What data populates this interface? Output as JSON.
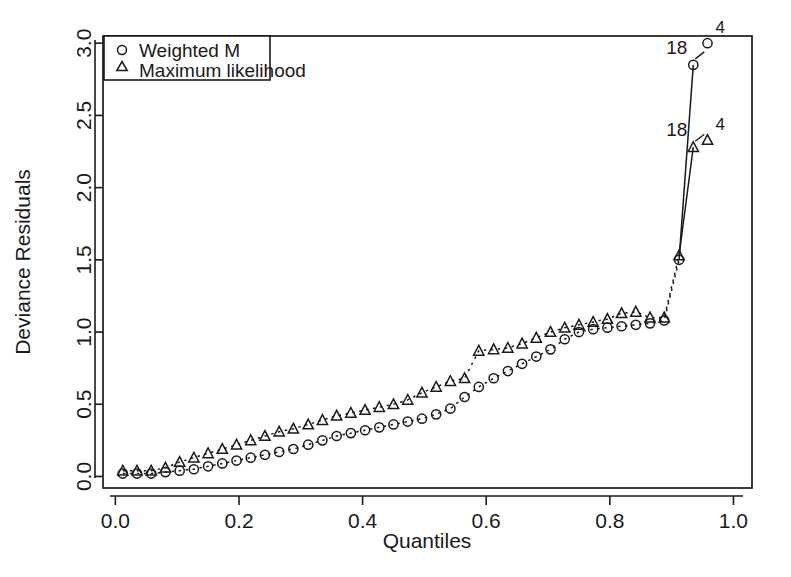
{
  "chart_data": {
    "type": "line",
    "title": "",
    "xlabel": "Quantiles",
    "ylabel": "Deviance Residuals",
    "xlim": [
      -0.02,
      1.03
    ],
    "ylim": [
      -0.08,
      3.05
    ],
    "grid": false,
    "legend_position": "top-left",
    "xticks": [
      "0.0",
      "0.2",
      "0.4",
      "0.6",
      "0.8",
      "1.0"
    ],
    "xtick_values": [
      0.0,
      0.2,
      0.4,
      0.6,
      0.8,
      1.0
    ],
    "yticks": [
      "0.0",
      "0.5",
      "1.0",
      "1.5",
      "2.0",
      "2.5",
      "3.0"
    ],
    "ytick_values": [
      0.0,
      0.5,
      1.0,
      1.5,
      2.0,
      2.5,
      3.0
    ],
    "series": [
      {
        "name": "Weighted M",
        "marker": "circle",
        "linestyle": "dashed",
        "x": [
          0.012,
          0.035,
          0.058,
          0.081,
          0.104,
          0.127,
          0.15,
          0.173,
          0.196,
          0.219,
          0.242,
          0.265,
          0.288,
          0.312,
          0.335,
          0.358,
          0.381,
          0.404,
          0.427,
          0.45,
          0.473,
          0.496,
          0.519,
          0.542,
          0.565,
          0.588,
          0.612,
          0.635,
          0.658,
          0.681,
          0.704,
          0.727,
          0.75,
          0.773,
          0.796,
          0.819,
          0.842,
          0.865,
          0.888,
          0.912,
          0.935,
          0.958
        ],
        "y": [
          0.02,
          0.02,
          0.02,
          0.03,
          0.04,
          0.05,
          0.07,
          0.09,
          0.11,
          0.13,
          0.15,
          0.17,
          0.19,
          0.22,
          0.25,
          0.28,
          0.3,
          0.32,
          0.34,
          0.36,
          0.38,
          0.4,
          0.43,
          0.47,
          0.55,
          0.62,
          0.68,
          0.73,
          0.78,
          0.83,
          0.88,
          0.95,
          1.0,
          1.02,
          1.03,
          1.04,
          1.05,
          1.06,
          1.08,
          1.5,
          2.85,
          3.0
        ]
      },
      {
        "name": "Maximum likelihood",
        "marker": "triangle",
        "linestyle": "dashed",
        "x": [
          0.012,
          0.035,
          0.058,
          0.081,
          0.104,
          0.127,
          0.15,
          0.173,
          0.196,
          0.219,
          0.242,
          0.265,
          0.288,
          0.312,
          0.335,
          0.358,
          0.381,
          0.404,
          0.427,
          0.45,
          0.473,
          0.496,
          0.519,
          0.542,
          0.565,
          0.588,
          0.612,
          0.635,
          0.658,
          0.681,
          0.704,
          0.727,
          0.75,
          0.773,
          0.796,
          0.819,
          0.842,
          0.865,
          0.888,
          0.912,
          0.935,
          0.958
        ],
        "y": [
          0.04,
          0.04,
          0.04,
          0.06,
          0.1,
          0.13,
          0.16,
          0.19,
          0.22,
          0.25,
          0.28,
          0.31,
          0.33,
          0.36,
          0.39,
          0.42,
          0.44,
          0.46,
          0.48,
          0.5,
          0.53,
          0.58,
          0.62,
          0.66,
          0.68,
          0.87,
          0.88,
          0.89,
          0.92,
          0.96,
          1.0,
          1.03,
          1.05,
          1.07,
          1.09,
          1.13,
          1.14,
          1.1,
          1.1,
          1.53,
          2.28,
          2.33
        ]
      }
    ],
    "annotations": [
      {
        "text": "18",
        "series": "Weighted M",
        "x": 0.935,
        "y": 2.85
      },
      {
        "text": "4",
        "series": "Weighted M",
        "x": 0.958,
        "y": 3.0
      },
      {
        "text": "18",
        "series": "Maximum likelihood",
        "x": 0.935,
        "y": 2.28
      },
      {
        "text": "4",
        "series": "Maximum likelihood",
        "x": 0.958,
        "y": 2.33
      }
    ]
  },
  "legend": {
    "entries": [
      {
        "label": "Weighted M",
        "marker": "circle"
      },
      {
        "label": "Maximum likelihood",
        "marker": "triangle"
      }
    ]
  },
  "colors": {
    "foreground": "#1a1a1a",
    "background": "#ffffff"
  }
}
